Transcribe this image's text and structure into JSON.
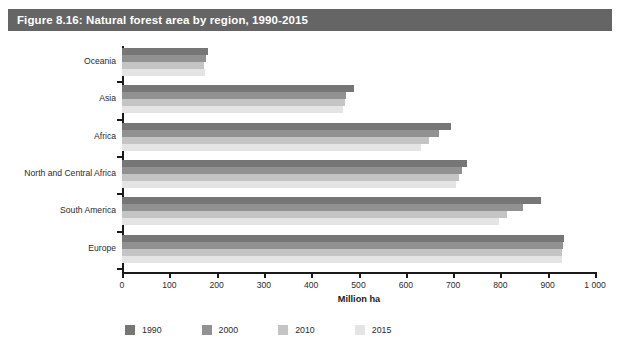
{
  "figure": {
    "caption": "Figure 8.16: Natural forest area by region, 1990-2015",
    "caption_bar_color": "#656565",
    "caption_text_color": "#ffffff"
  },
  "chart_data": {
    "type": "bar",
    "orientation": "horizontal",
    "title": "Figure 8.16: Natural forest area by region, 1990-2015",
    "xlabel": "Million ha",
    "ylabel": "",
    "xlim": [
      0,
      1000
    ],
    "xticks": [
      0,
      100,
      200,
      300,
      400,
      500,
      600,
      700,
      800,
      900,
      1000
    ],
    "xticklabels": [
      "0",
      "100",
      "200",
      "300",
      "400",
      "500",
      "600",
      "700",
      "800",
      "900",
      "1 000"
    ],
    "grid": false,
    "legend_position": "bottom",
    "categories": [
      "Oceania",
      "Asia",
      "Africa",
      "North and Central Africa",
      "South America",
      "Europe"
    ],
    "series": [
      {
        "name": "1990",
        "color": "#767676",
        "values": [
          181,
          490,
          695,
          730,
          885,
          935
        ]
      },
      {
        "name": "2000",
        "color": "#919191",
        "values": [
          177,
          474,
          671,
          719,
          848,
          933
        ]
      },
      {
        "name": "2010",
        "color": "#c4c4c4",
        "values": [
          174,
          471,
          648,
          712,
          815,
          931
        ]
      },
      {
        "name": "2015",
        "color": "#e4e4e4",
        "values": [
          176,
          468,
          632,
          707,
          796,
          930
        ]
      }
    ]
  }
}
